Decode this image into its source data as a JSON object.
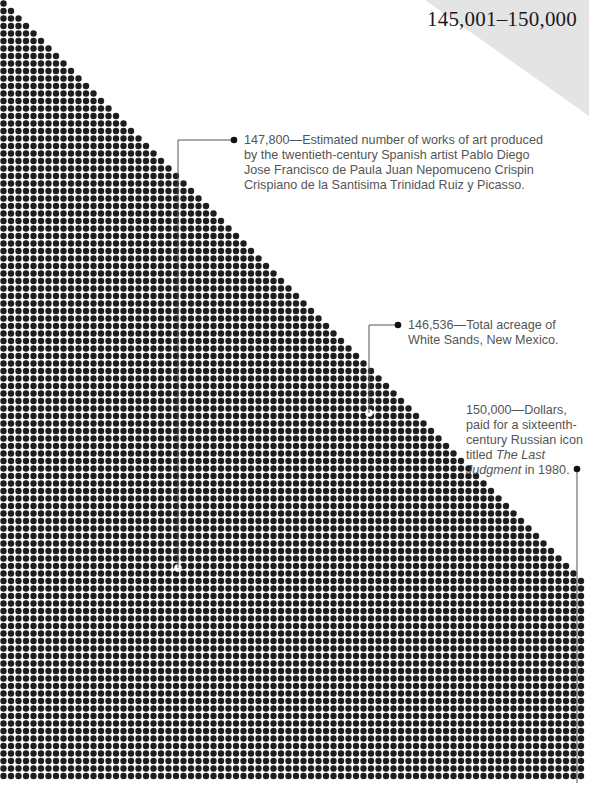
{
  "range_label": "145,001–150,000",
  "colors": {
    "dot": "#1e1e1e",
    "highlight": "#ffffff",
    "corner": "#e4e4e4",
    "leader": "#555555",
    "text": "#555555"
  },
  "annotations": [
    {
      "value": "147,800",
      "dash": "—",
      "text": "Estimated number of works of art produced by the twentieth-century Spanish artist Pablo Diego Jose Francisco de Paula Juan Nepomuceno Crispin Crispiano de la Santisima Trinidad Ruiz y Picasso."
    },
    {
      "value": "146,536",
      "dash": "—",
      "text": "Total acreage of White Sands, New Mexico."
    },
    {
      "value": "150,000",
      "dash": "—",
      "text_before": "Dollars, paid for a sixteenth-century Russian icon titled ",
      "italic": "The Last Judgment",
      "text_after": " in 1980."
    }
  ],
  "chart_data": {
    "type": "scatter",
    "title": "145,001–150,000",
    "grid": {
      "pitch": 7.5,
      "dot_radius": 3.2,
      "origin_x": 3.5,
      "origin_y": 3.5,
      "columns": 78,
      "rows": 104,
      "triangle_rows": 78
    },
    "highlights": [
      {
        "value": 147800,
        "x": 178,
        "y": 568
      },
      {
        "value": 146536,
        "x": 369,
        "y": 413
      },
      {
        "value": 150000,
        "x": 577,
        "y": 783
      }
    ],
    "leaders": [
      {
        "points": [
          [
            178,
            568
          ],
          [
            178,
            140
          ],
          [
            234,
            140
          ]
        ],
        "end_dot": [
          234,
          140
        ]
      },
      {
        "points": [
          [
            369,
            413
          ],
          [
            369,
            325
          ],
          [
            398,
            325
          ]
        ],
        "end_dot": [
          398,
          325
        ]
      },
      {
        "points": [
          [
            577,
            783
          ],
          [
            577,
            469
          ]
        ],
        "end_dot": [
          577,
          469
        ]
      }
    ]
  }
}
